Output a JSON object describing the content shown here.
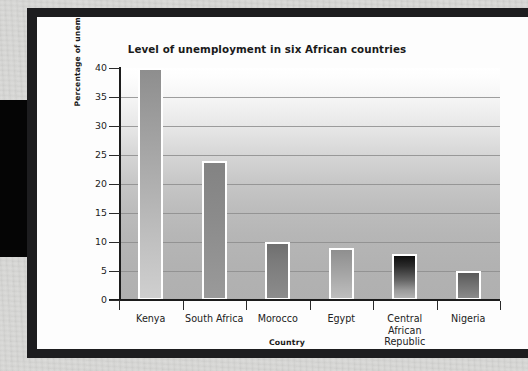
{
  "figure": {
    "frame_color": "#1d1d1f",
    "card_color": "#fdfdfd"
  },
  "chart_data": {
    "type": "bar",
    "title": "Level of unemployment in six African countries",
    "xlabel": "Country",
    "ylabel": "Percentage of unemployed",
    "categories": [
      "Kenya",
      "South Africa",
      "Morocco",
      "Egypt",
      "Central African Republic",
      "Nigeria"
    ],
    "values": [
      40,
      24,
      10,
      9,
      8,
      5
    ],
    "ylim": [
      0,
      40
    ],
    "yticks": [
      0,
      5,
      10,
      15,
      20,
      25,
      30,
      35,
      40
    ],
    "ytick_labels": [
      "0",
      "5",
      "10",
      "15",
      "20",
      "25",
      "30",
      "35",
      "40"
    ],
    "grid": true,
    "legend": "none",
    "bar_edge_color": "#ffffff",
    "plot_background": "vertical gradient white to gray"
  },
  "category_label_lines": [
    [
      "Kenya"
    ],
    [
      "South Africa"
    ],
    [
      "Morocco"
    ],
    [
      "Egypt"
    ],
    [
      "Central",
      "African",
      "Republic"
    ],
    [
      "Nigeria"
    ]
  ]
}
